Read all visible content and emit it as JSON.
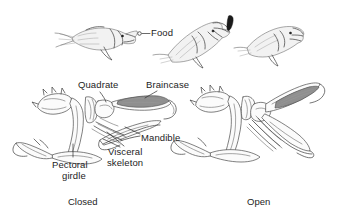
{
  "figure": {
    "background_color": "#ffffff",
    "ink_color": "#3a3a3a",
    "shade_color": "#c9c9c9",
    "braincase_shade_color": "#8f8f8f"
  },
  "top_row": {
    "label_food": "Food",
    "fish": [
      {
        "name": "fish-approach",
        "state": "mouth closed, approaching food"
      },
      {
        "name": "fish-strike",
        "state": "mouth open, engulfing food"
      },
      {
        "name": "fish-after",
        "state": "mouth closing after capture"
      }
    ]
  },
  "skull_labels": {
    "quadrate": "Quadrate",
    "braincase": "Braincase",
    "mandible": "Mandible",
    "visceral_line1": "Visceral",
    "visceral_line2": "skeleton",
    "pectoral_line1": "Pectoral",
    "pectoral_line2": "girdle"
  },
  "captions": {
    "left": "Closed",
    "right": "Open"
  }
}
